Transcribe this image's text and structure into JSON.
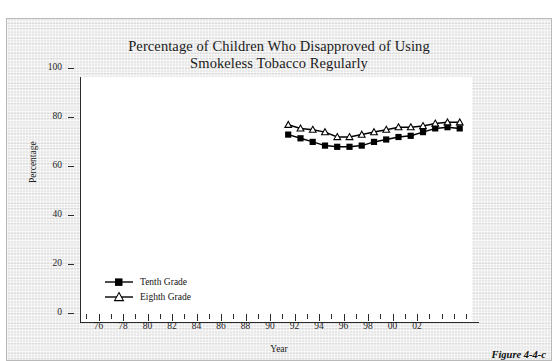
{
  "figure": {
    "caption": "Figure 4-4-c"
  },
  "legend": {
    "position": "inside-bottom-left",
    "items": [
      {
        "label": "Tenth Grade",
        "marker": "filled-square"
      },
      {
        "label": "Eighth Grade",
        "marker": "open-triangle"
      }
    ]
  },
  "chart_data": {
    "type": "line",
    "title": "Percentage of Children Who Disapproved of Using Smokeless Tobacco Regularly",
    "title_line1": "Percentage of Children Who Disapproved of Using",
    "title_line2": "Smokeless Tobacco Regularly",
    "xlabel": "Year",
    "ylabel": "Percentage",
    "xlim": [
      1974,
      2006
    ],
    "ylim": [
      0,
      100
    ],
    "grid": false,
    "ytick_labels": [
      "0",
      "20",
      "40",
      "60",
      "80",
      "100"
    ],
    "ytick_values": [
      0,
      20,
      40,
      60,
      80,
      100
    ],
    "xtick_labels": [
      "76",
      "78",
      "80",
      "82",
      "84",
      "86",
      "88",
      "90",
      "92",
      "94",
      "96",
      "98",
      "00",
      "02"
    ],
    "xtick_values": [
      1976,
      1978,
      1980,
      1982,
      1984,
      1986,
      1988,
      1990,
      1992,
      1994,
      1996,
      1998,
      2000,
      2002
    ],
    "xtick_minor_step": 1,
    "x": [
      1991,
      1992,
      1993,
      1994,
      1995,
      1996,
      1997,
      1998,
      1999,
      2000,
      2001,
      2002,
      2003,
      2004,
      2005
    ],
    "series": [
      {
        "name": "Tenth Grade",
        "marker": "filled-square",
        "color": "#000000",
        "values": [
          76.5,
          75.0,
          73.5,
          72.0,
          71.5,
          71.5,
          72.0,
          73.5,
          74.5,
          75.5,
          76.0,
          77.5,
          79.0,
          79.5,
          79.0
        ]
      },
      {
        "name": "Eighth Grade",
        "marker": "open-triangle",
        "color": "#000000",
        "values": [
          80.5,
          79.0,
          78.5,
          77.5,
          75.5,
          75.5,
          76.5,
          77.5,
          78.5,
          79.5,
          79.5,
          80.0,
          81.0,
          81.5,
          81.5
        ]
      }
    ]
  }
}
